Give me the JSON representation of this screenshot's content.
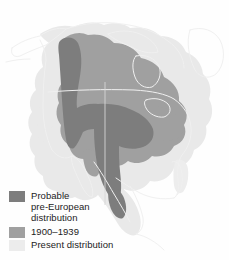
{
  "figure": {
    "background_color": "#fefefe",
    "width": 229,
    "height": 260
  },
  "map": {
    "region": "North America",
    "outline_color": "#f2f2f2",
    "meridian_line_color": "#d8d8d8",
    "ranges": [
      {
        "key": "probable_pre_european",
        "color": "#7d7d7d"
      },
      {
        "key": "range_1900_1939",
        "color": "#a0a0a0"
      },
      {
        "key": "present",
        "color": "#e9e9e9"
      }
    ]
  },
  "legend": {
    "items": [
      {
        "swatch_color": "#7d7d7d",
        "label": "Probable\npre-European\ndistribution"
      },
      {
        "swatch_color": "#a0a0a0",
        "label": "1900–1939"
      },
      {
        "swatch_color": "#ececec",
        "label": "Present distribution"
      }
    ]
  }
}
